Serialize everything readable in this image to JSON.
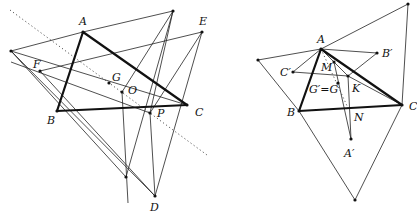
{
  "figures": [
    {
      "id": "left",
      "labels": {
        "A": "A",
        "B": "B",
        "C": "C",
        "D": "D",
        "E": "E",
        "F": "F",
        "G": "G",
        "O": "O",
        "P": "P"
      }
    },
    {
      "id": "right",
      "labels": {
        "A": "A",
        "B": "B",
        "C": "C",
        "B_prime": "B′",
        "C_prime": "C′",
        "A_prime": "A′",
        "M": "M",
        "K": "K",
        "N": "N",
        "G_eq": "G′=G"
      }
    }
  ],
  "colors": {
    "stroke": "#111111",
    "background": "#ffffff"
  }
}
